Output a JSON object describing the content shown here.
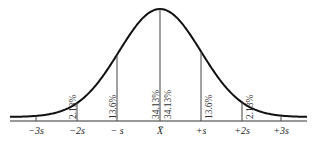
{
  "diagram": {
    "mean_label": "X̄",
    "axis_labels": [
      "−3s",
      "−2s",
      "− s",
      "X̄",
      "+s",
      "+2s",
      "+3s"
    ],
    "tick_x": [
      36,
      77,
      117,
      160,
      201,
      242,
      281
    ],
    "percent_labels": [
      {
        "text": "2.13%",
        "x": 73,
        "side": "left-of-line"
      },
      {
        "text": "13.6%",
        "x": 113,
        "side": "left-of-line"
      },
      {
        "text": "34.13%",
        "x": 156,
        "side": "left-of-line"
      },
      {
        "text": "34.13%",
        "x": 168,
        "side": "right-of-line"
      },
      {
        "text": "13.6%",
        "x": 209,
        "side": "right-of-line"
      },
      {
        "text": "2.13%",
        "x": 250,
        "side": "right-of-line"
      }
    ],
    "colors": {
      "curve": "#111111",
      "lines": "#444444",
      "text": "#222222"
    }
  },
  "chart_data": {
    "type": "area",
    "categories": [
      "−3s to −2s",
      "−2s to −s",
      "−s to X̄",
      "X̄ to +s",
      "+s to +2s",
      "+2s to +3s"
    ],
    "values": [
      2.13,
      13.6,
      34.13,
      34.13,
      13.6,
      2.13
    ],
    "xlabel": "",
    "ylabel": "",
    "x_ticks": [
      "−3s",
      "−2s",
      "−s",
      "X̄",
      "+s",
      "+2s",
      "+3s"
    ]
  }
}
